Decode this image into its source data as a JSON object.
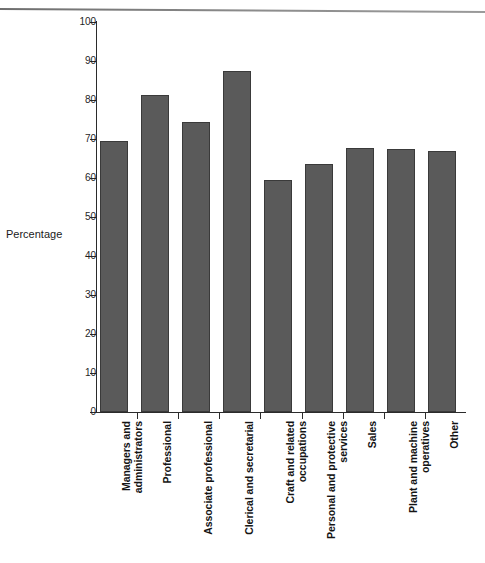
{
  "chart_data": {
    "type": "bar",
    "title": "",
    "xlabel": "",
    "ylabel": "Percentage",
    "ylim": [
      0,
      100
    ],
    "ytick_step": 10,
    "yticks": [
      100,
      90,
      80,
      70,
      60,
      50,
      40,
      30,
      20,
      10,
      0
    ],
    "grid": false,
    "legend": null,
    "bar_color": "#5a5a5a",
    "bar_edge_color": "#3a3a3a",
    "categories": [
      "Managers and\nadministrators",
      "Professional",
      "Associate professional",
      "Clerical and secretarial",
      "Craft and related\noccupations",
      "Personal and protective\nservices",
      "Sales",
      "Plant and machine\noperatives",
      "Other"
    ],
    "values": [
      69.5,
      81.2,
      74.3,
      87.5,
      59.5,
      63.7,
      67.6,
      67.5,
      67.0
    ]
  },
  "caption": {
    "text": ""
  }
}
